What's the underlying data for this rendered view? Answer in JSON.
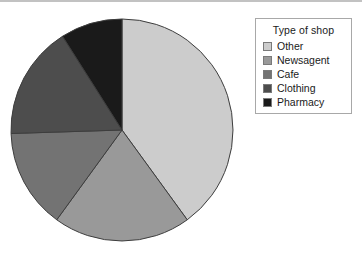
{
  "chart_data": {
    "type": "pie",
    "title": "",
    "legend_title": "Type of shop",
    "legend_position": "right",
    "categories": [
      "Other",
      "Newsagent",
      "Cafe",
      "Clothing",
      "Pharmacy"
    ],
    "values": [
      40,
      20,
      14.5,
      16.5,
      9
    ],
    "unit": "percent",
    "start_angle_deg": 0,
    "direction": "clockwise",
    "slices": [
      {
        "label": "Other",
        "value": 40,
        "color": "#cccccc",
        "start_deg": 0,
        "end_deg": 144
      },
      {
        "label": "Newsagent",
        "value": 20,
        "color": "#999999",
        "start_deg": 144,
        "end_deg": 216
      },
      {
        "label": "Cafe",
        "value": 14.5,
        "color": "#737373",
        "start_deg": 216,
        "end_deg": 268.2
      },
      {
        "label": "Clothing",
        "value": 16.5,
        "color": "#4d4d4d",
        "start_deg": 268.2,
        "end_deg": 327.6
      },
      {
        "label": "Pharmacy",
        "value": 9,
        "color": "#1a1a1a",
        "start_deg": 327.6,
        "end_deg": 360
      }
    ],
    "geometry": {
      "cx": 112,
      "cy": 112,
      "r": 111
    },
    "style": {
      "slice_outline": "#3d3d3d",
      "legend_border": "#a8a8a8",
      "legend_swatch_border": "#7a7a7a",
      "text_color": "#1a1a1a",
      "background": "#ffffff",
      "top_rule": "#c2c2c2"
    }
  }
}
